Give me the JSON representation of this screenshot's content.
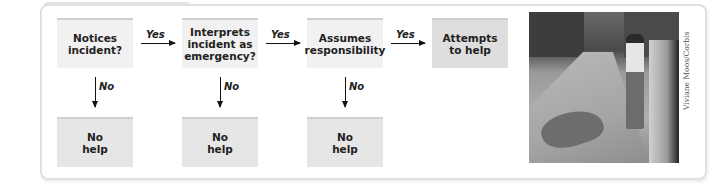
{
  "diagram": {
    "steps": [
      {
        "label": "Notices\nincident?"
      },
      {
        "label": "Interprets\nincident as\nemergency?"
      },
      {
        "label": "Assumes\nresponsibility"
      },
      {
        "label": "Attempts\nto help"
      }
    ],
    "yes_label": "Yes",
    "no_label": "No",
    "outcomes": [
      {
        "label": "No\nhelp"
      },
      {
        "label": "No\nhelp"
      },
      {
        "label": "No\nhelp"
      }
    ],
    "colors": {
      "box": "#f1f1f1",
      "final_box": "#dedede",
      "outcome_box": "#e6e6e6",
      "arrow": "#111111"
    }
  },
  "photo": {
    "description": "Street scene: man lying on sidewalk while a passerby walks by",
    "credit": "Viviane Moos/Corbis"
  }
}
